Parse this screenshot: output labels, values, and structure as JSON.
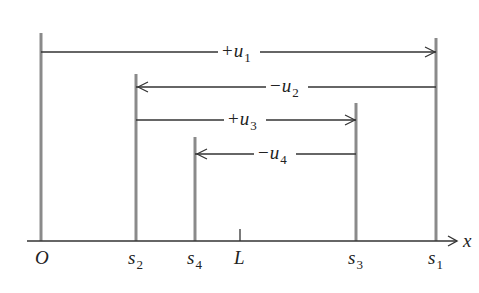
{
  "diagram": {
    "colors": {
      "vertical_line": "#8a8a8a",
      "arrow": "#333333",
      "axis": "#333333",
      "text": "#222222"
    },
    "axis": {
      "label": "x",
      "y": 241,
      "x_start": 27,
      "x_end": 457
    },
    "points": [
      {
        "id": "O",
        "label": "O",
        "sub": "",
        "x": 41,
        "top": 33,
        "kind": "line"
      },
      {
        "id": "s2",
        "label": "s",
        "sub": "2",
        "x": 136,
        "top": 74,
        "kind": "line"
      },
      {
        "id": "s4",
        "label": "s",
        "sub": "4",
        "x": 195,
        "top": 137,
        "kind": "line"
      },
      {
        "id": "L",
        "label": "L",
        "sub": "",
        "x": 240,
        "top": 229,
        "kind": "tick"
      },
      {
        "id": "s3",
        "label": "s",
        "sub": "3",
        "x": 356,
        "top": 103,
        "kind": "line"
      },
      {
        "id": "s1",
        "label": "s",
        "sub": "1",
        "x": 436,
        "top": 38,
        "kind": "line"
      }
    ],
    "displacements": [
      {
        "id": "u1",
        "sign": "+",
        "var": "u",
        "sub": "1",
        "from_x": 41,
        "to_x": 436,
        "y": 52,
        "direction": "right",
        "label_x": 222
      },
      {
        "id": "u2",
        "sign": "−",
        "var": "u",
        "sub": "2",
        "from_x": 436,
        "to_x": 136,
        "y": 87,
        "direction": "left",
        "label_x": 270
      },
      {
        "id": "u3",
        "sign": "+",
        "var": "u",
        "sub": "3",
        "from_x": 136,
        "to_x": 356,
        "y": 120,
        "direction": "right",
        "label_x": 228
      },
      {
        "id": "u4",
        "sign": "−",
        "var": "u",
        "sub": "4",
        "from_x": 356,
        "to_x": 195,
        "y": 154,
        "direction": "left",
        "label_x": 258
      }
    ]
  }
}
